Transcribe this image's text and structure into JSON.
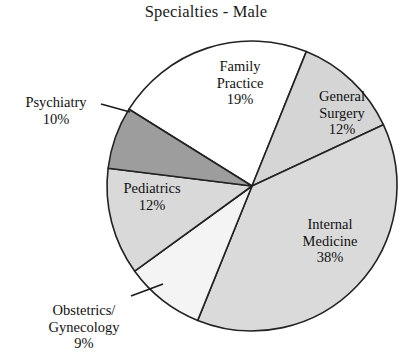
{
  "chart_data": {
    "type": "pie",
    "title": "Specialties - Male",
    "categories": [
      "Family Practice",
      "General Surgery",
      "Internal Medicine",
      "Obstetrics/Gynecology",
      "Pediatrics",
      "Psychiatry"
    ],
    "values": [
      19,
      12,
      38,
      9,
      12,
      10
    ],
    "unit": "%",
    "legend": "none",
    "labels_inside": [
      "Family Practice",
      "General Surgery",
      "Internal Medicine",
      "Pediatrics"
    ],
    "labels_outside": [
      "Psychiatry",
      "Obstetrics/Gynecology"
    ],
    "slices": [
      {
        "name": "family-practice",
        "label_line1": "Family",
        "label_line2": "Practice",
        "value_text": "19%",
        "value": 19,
        "color": "#ffffff",
        "start_deg": -58,
        "end_deg": 22
      },
      {
        "name": "general-surgery",
        "label_line1": "General",
        "label_line2": "Surgery",
        "value_text": "12%",
        "value": 12,
        "color": "#d5d5d5",
        "start_deg": 22,
        "end_deg": 65
      },
      {
        "name": "internal-medicine",
        "label_line1": "Internal",
        "label_line2": "Medicine",
        "value_text": "38%",
        "value": 38,
        "color": "#dadada",
        "start_deg": 65,
        "end_deg": 202
      },
      {
        "name": "obstetrics-gynecology",
        "label_line1": "Obstetrics/",
        "label_line2": "Gynecology",
        "value_text": "9%",
        "value": 9,
        "color": "#f4f4f4",
        "start_deg": 202,
        "end_deg": 234
      },
      {
        "name": "pediatrics",
        "label_line1": "Pediatrics",
        "label_line2": "",
        "value_text": "12%",
        "value": 12,
        "color": "#d9d9d9",
        "start_deg": 234,
        "end_deg": 277
      },
      {
        "name": "psychiatry",
        "label_line1": "Psychiatry",
        "label_line2": "",
        "value_text": "10%",
        "value": 10,
        "color": "#9d9d9d",
        "start_deg": 277,
        "end_deg": 302
      }
    ],
    "geometry": {
      "center_x": 252,
      "center_y": 186,
      "radius": 145
    },
    "stroke_color": "#222222"
  },
  "labels": {
    "family_practice": "Family\nPractice\n19%",
    "general_surgery": "General\nSurgery\n12%",
    "internal_medicine": "Internal\nMedicine\n38%",
    "psychiatry": "Psychiatry\n10%",
    "pediatrics": "Pediatrics\n12%",
    "obstetrics_gynecology": "Obstetrics/\nGynecology\n9%"
  }
}
